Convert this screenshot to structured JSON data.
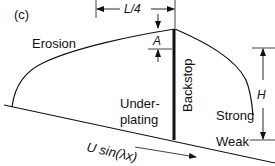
{
  "panel_label": "(c)",
  "labels": {
    "erosion": "Erosion",
    "underplating_line1": "Under-",
    "underplating_line2": "plating",
    "backstop": "Backstop",
    "strong": "Strong",
    "weak": "Weak",
    "velocity": "U sin(λx)"
  },
  "dimensions": {
    "width_label": "L/4",
    "dip_label": "A",
    "height_label": "H"
  },
  "colors": {
    "line": "#111111",
    "background": "#ffffff"
  }
}
